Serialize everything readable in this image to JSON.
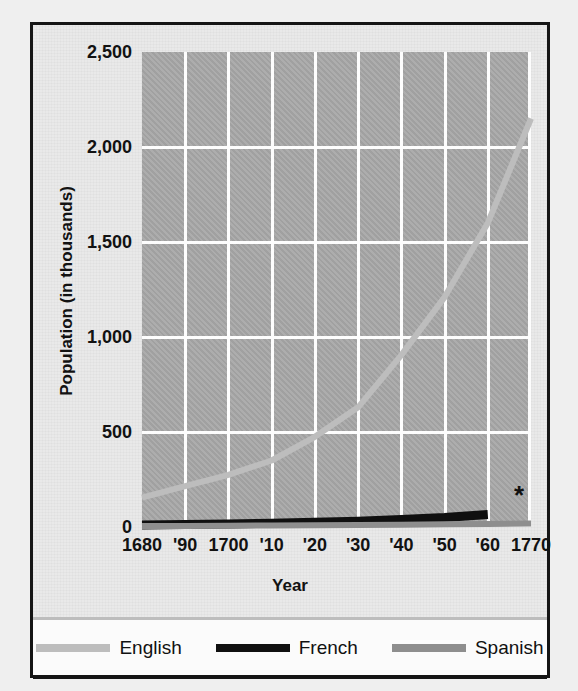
{
  "chart_data": {
    "type": "line",
    "title": "",
    "xlabel": "Year",
    "ylabel": "Population (in thousands)",
    "ylim": [
      0,
      2500
    ],
    "xlim": [
      1680,
      1770
    ],
    "yticks": [
      "2,500",
      "2,000",
      "1,500",
      "1,000",
      "500",
      "0"
    ],
    "ytick_values": [
      2500,
      2000,
      1500,
      1000,
      500,
      0
    ],
    "xticks": [
      "1680",
      "'90",
      "1700",
      "'10",
      "'20",
      "'30",
      "'40",
      "'50",
      "'60",
      "1770"
    ],
    "x": [
      1680,
      1690,
      1700,
      1710,
      1720,
      1730,
      1740,
      1750,
      1760,
      1770
    ],
    "grid": true,
    "legend_position": "bottom",
    "annotation": "*",
    "series": [
      {
        "name": "English",
        "color": "#bdbdbd",
        "values": [
          155,
          215,
          275,
          350,
          475,
          630,
          905,
          1210,
          1600,
          2150
        ]
      },
      {
        "name": "French",
        "color": "#101010",
        "values": [
          10,
          13,
          16,
          20,
          25,
          30,
          40,
          50,
          65,
          null
        ]
      },
      {
        "name": "Spanish",
        "color": "#8e8e8e",
        "values": [
          5,
          6,
          7,
          8,
          9,
          10,
          12,
          14,
          16,
          18
        ]
      }
    ]
  },
  "axis": {
    "y_title": "Population (in thousands)",
    "x_title": "Year"
  },
  "legend": {
    "items": [
      {
        "label": "English",
        "color": "#bdbdbd"
      },
      {
        "label": "French",
        "color": "#101010"
      },
      {
        "label": "Spanish",
        "color": "#8e8e8e"
      }
    ]
  },
  "ghost_top_text": ""
}
